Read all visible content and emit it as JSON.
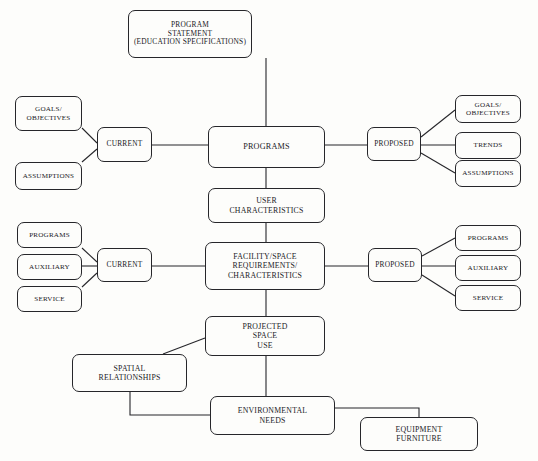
{
  "diagram": {
    "line_color": "#26262a",
    "background_color": "#fdfdfb",
    "nodes": [
      {
        "id": "program-statement",
        "label": "PROGRAM\nSTATEMENT\n(EDUCATION SPECIFICATIONS)",
        "x": 128,
        "y": 10,
        "w": 124,
        "h": 48,
        "size": "small"
      },
      {
        "id": "goals-objectives-current",
        "label": "GOALS/\nOBJECTIVES",
        "x": 15,
        "y": 96,
        "w": 67,
        "h": 35,
        "size": "tiny"
      },
      {
        "id": "assumptions-current",
        "label": "ASSUMPTIONS",
        "x": 15,
        "y": 162,
        "w": 67,
        "h": 28,
        "size": "tiny"
      },
      {
        "id": "current-programs",
        "label": "CURRENT",
        "x": 97,
        "y": 127,
        "w": 55,
        "h": 35,
        "size": "small"
      },
      {
        "id": "programs",
        "label": "PROGRAMS",
        "x": 208,
        "y": 126,
        "w": 117,
        "h": 42,
        "size": "main"
      },
      {
        "id": "proposed-programs",
        "label": "PROPOSED",
        "x": 367,
        "y": 127,
        "w": 54,
        "h": 34,
        "size": "small"
      },
      {
        "id": "goals-objectives-proposed",
        "label": "GOALS/\nOBJECTIVES",
        "x": 455,
        "y": 95,
        "w": 66,
        "h": 28,
        "size": "tiny"
      },
      {
        "id": "trends-proposed",
        "label": "TRENDS",
        "x": 455,
        "y": 132,
        "w": 66,
        "h": 27,
        "size": "tiny"
      },
      {
        "id": "assumptions-proposed",
        "label": "ASSUMPTIONS",
        "x": 455,
        "y": 160,
        "w": 66,
        "h": 27,
        "size": "tiny"
      },
      {
        "id": "user-characteristics",
        "label": "USER\nCHARACTERISTICS",
        "x": 208,
        "y": 188,
        "w": 117,
        "h": 35,
        "size": "mid"
      },
      {
        "id": "programs-current-facility",
        "label": "PROGRAMS",
        "x": 17,
        "y": 222,
        "w": 65,
        "h": 26,
        "size": "tiny"
      },
      {
        "id": "auxiliary-current",
        "label": "AUXILIARY",
        "x": 17,
        "y": 254,
        "w": 65,
        "h": 26,
        "size": "tiny"
      },
      {
        "id": "service-current",
        "label": "SERVICE",
        "x": 17,
        "y": 286,
        "w": 65,
        "h": 26,
        "size": "tiny"
      },
      {
        "id": "current-facility",
        "label": "CURRENT",
        "x": 97,
        "y": 248,
        "w": 55,
        "h": 34,
        "size": "small"
      },
      {
        "id": "facility-space-requirements",
        "label": "FACILITY/SPACE\nREQUIREMENTS/\nCHARACTERISTICS",
        "x": 205,
        "y": 242,
        "w": 120,
        "h": 48,
        "size": "mid"
      },
      {
        "id": "proposed-facility",
        "label": "PROPOSED",
        "x": 368,
        "y": 248,
        "w": 54,
        "h": 34,
        "size": "small"
      },
      {
        "id": "programs-proposed-facility",
        "label": "PROGRAMS",
        "x": 455,
        "y": 225,
        "w": 66,
        "h": 26,
        "size": "tiny"
      },
      {
        "id": "auxiliary-proposed",
        "label": "AUXILIARY",
        "x": 455,
        "y": 255,
        "w": 66,
        "h": 26,
        "size": "tiny"
      },
      {
        "id": "service-proposed",
        "label": "SERVICE",
        "x": 455,
        "y": 285,
        "w": 66,
        "h": 26,
        "size": "tiny"
      },
      {
        "id": "projected-space-use",
        "label": "PROJECTED\nSPACE\nUSE",
        "x": 205,
        "y": 316,
        "w": 120,
        "h": 40,
        "size": "mid"
      },
      {
        "id": "spatial-relationships",
        "label": "SPATIAL\nRELATIONSHIPS",
        "x": 72,
        "y": 354,
        "w": 115,
        "h": 38,
        "size": "mid"
      },
      {
        "id": "environmental-needs",
        "label": "ENVIRONMENTAL\nNEEDS",
        "x": 210,
        "y": 396,
        "w": 125,
        "h": 39,
        "size": "mid"
      },
      {
        "id": "equipment-furniture",
        "label": "EQUIPMENT\nFURNITURE",
        "x": 360,
        "y": 417,
        "w": 118,
        "h": 34,
        "size": "mid"
      }
    ],
    "edges": [
      {
        "id": "program-statement-to-programs",
        "points": "266,58 266,126"
      },
      {
        "id": "goals-objectives-to-current",
        "points": "82,128 97,143"
      },
      {
        "id": "assumptions-to-current",
        "points": "82,162 97,149"
      },
      {
        "id": "current-to-programs",
        "points": "152,145 208,145"
      },
      {
        "id": "programs-to-proposed",
        "points": "325,145 367,145"
      },
      {
        "id": "proposed-to-goals-objectives",
        "points": "421,137 455,110"
      },
      {
        "id": "proposed-to-trends",
        "points": "421,145 455,145"
      },
      {
        "id": "proposed-to-assumptions",
        "points": "421,153 455,173"
      },
      {
        "id": "programs-to-user-characteristics",
        "points": "266,168 266,188"
      },
      {
        "id": "user-characteristics-to-facility",
        "points": "266,223 266,242"
      },
      {
        "id": "programs-current-to-current-facility",
        "points": "82,248 97,262"
      },
      {
        "id": "auxiliary-to-current-facility",
        "points": "82,266 97,266"
      },
      {
        "id": "service-to-current-facility",
        "points": "82,287 97,273"
      },
      {
        "id": "current-facility-to-facility",
        "points": "152,266 205,266"
      },
      {
        "id": "facility-to-proposed-facility",
        "points": "325,266 368,266"
      },
      {
        "id": "proposed-facility-to-programs",
        "points": "422,256 455,238"
      },
      {
        "id": "proposed-facility-to-auxiliary",
        "points": "422,266 455,266"
      },
      {
        "id": "proposed-facility-to-service",
        "points": "422,275 455,296"
      },
      {
        "id": "facility-to-projected-space-use",
        "points": "266,290 266,316"
      },
      {
        "id": "projected-space-use-to-spatial-relationships",
        "points": "205,338 163,354"
      },
      {
        "id": "projected-space-use-to-environmental-needs",
        "points": "266,356 266,396"
      },
      {
        "id": "spatial-relationships-to-environmental-needs",
        "points": "130,392 130,415 210,415"
      },
      {
        "id": "environmental-needs-to-equipment-furniture",
        "points": "335,408 419,408 419,417"
      }
    ]
  }
}
